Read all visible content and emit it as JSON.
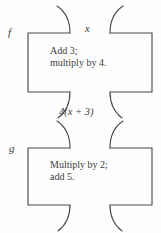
{
  "figure": {
    "type": "function-machine-diagram",
    "background_color": "#fefefe",
    "stroke_color": "#4a4a4a",
    "text_color": "#3b3b3b"
  },
  "machines": [
    {
      "name": "f",
      "input_label": "x",
      "rule_line_1": "Add 3;",
      "rule_line_2": "multiply by 4.",
      "output_label": "4(x + 3)"
    },
    {
      "name": "g",
      "input_label": "4(x + 3)",
      "rule_line_1": "Multiply by 2;",
      "rule_line_2": "add 5.",
      "output_label": ""
    }
  ],
  "labels": {
    "f_name": "f",
    "g_name": "g",
    "top_input": "x",
    "middle_value": "4(x + 3)",
    "machine1_rule": "Add 3;\nmultiply by 4.",
    "machine2_rule": "Multiply by 2;\nadd 5."
  }
}
